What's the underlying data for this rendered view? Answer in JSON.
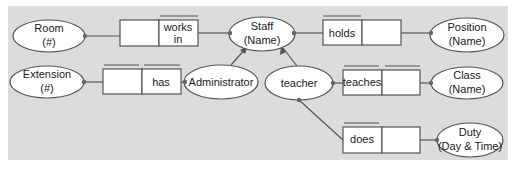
{
  "colors": {
    "background": "#dcdcdc",
    "shape_fill": "#ffffff",
    "stroke": "#555555",
    "dot": "#666666"
  },
  "entities": {
    "room": {
      "line1": "Room",
      "line2": "(#)"
    },
    "staff": {
      "line1": "Staff",
      "line2": "(Name)"
    },
    "position": {
      "line1": "Position",
      "line2": "(Name)"
    },
    "extension": {
      "line1": "Extension",
      "line2": "(#)"
    },
    "administrator": {
      "line1": "Administrator"
    },
    "teacher": {
      "line1": "teacher"
    },
    "class": {
      "line1": "Class",
      "line2": "(Name)"
    },
    "duty": {
      "line1": "Duty",
      "line2": "(Day & Time)"
    }
  },
  "facts": {
    "works_in": {
      "line1": "works",
      "line2": "in"
    },
    "holds": {
      "label": "holds"
    },
    "has": {
      "label": "has"
    },
    "teaches": {
      "label": "teaches"
    },
    "does": {
      "label": "does"
    }
  }
}
